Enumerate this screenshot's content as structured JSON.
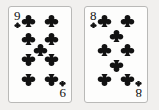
{
  "scene": {
    "description": "Two playing cards face up",
    "background_color": "#f1f0ee",
    "card_face_color": "#fdfdfc",
    "card_border_color": "#b9b9b7",
    "suit_color": "#121212"
  },
  "cards": [
    {
      "name": "nine-of-clubs",
      "rank": "9",
      "rank_inverted": "9",
      "suit": "clubs",
      "suit_symbol": "♣",
      "suit_color": "#121212",
      "pip_count": 9,
      "pip_layout": "four-left four-right one-center"
    },
    {
      "name": "eight-of-clubs",
      "rank": "8",
      "rank_inverted": "8",
      "suit": "clubs",
      "suit_symbol": "♣",
      "suit_color": "#121212",
      "pip_count": 8,
      "pip_layout": "three-left three-right two-center"
    }
  ]
}
